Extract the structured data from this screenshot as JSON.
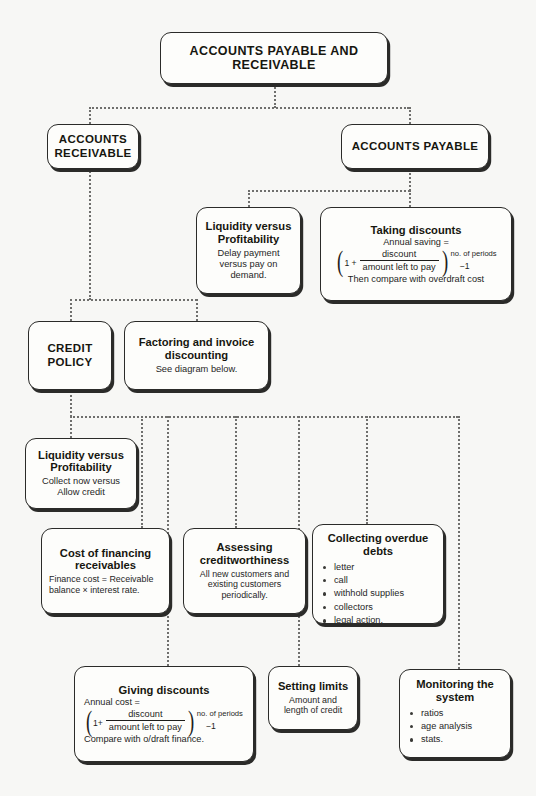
{
  "diagram": {
    "title": "ACCOUNTS PAYABLE AND RECEIVABLE",
    "background_color": "#f7f7f5",
    "line_color": "#6f6f6d",
    "box_border_color": "#2b2b29"
  },
  "nodes": {
    "root": {
      "title": "ACCOUNTS PAYABLE AND RECEIVABLE"
    },
    "accounts_receivable": {
      "title": "ACCOUNTS RECEIVABLE"
    },
    "accounts_payable": {
      "title": "ACCOUNTS PAYABLE"
    },
    "liquidity_payable": {
      "title": "Liquidity versus Profitability",
      "body": "Delay payment versus pay on demand."
    },
    "taking_discounts": {
      "title": "Taking discounts",
      "line1": "Annual saving =",
      "formula": {
        "lead": "1 +",
        "numerator": "discount",
        "denominator": "amount left to pay",
        "exponent": "no. of periods",
        "minus_one": "−1"
      },
      "footer": "Then compare with overdraft cost"
    },
    "credit_policy": {
      "title": "CREDIT POLICY"
    },
    "factoring": {
      "title": "Factoring and invoice discounting",
      "body": "See diagram below."
    },
    "liquidity_receivable": {
      "title": "Liquidity versus Profitability",
      "body": "Collect now versus Allow credit"
    },
    "cost_of_financing": {
      "title": "Cost of financing receivables",
      "body": "Finance cost = Receivable balance × interest rate."
    },
    "assessing_creditworthiness": {
      "title": "Assessing creditworthiness",
      "body": "All new customers and existing customers periodically."
    },
    "collecting_overdue_debts": {
      "title": "Collecting overdue debts",
      "bullets": [
        "letter",
        "call",
        "withhold supplies",
        "collectors",
        "legal action."
      ]
    },
    "giving_discounts": {
      "title": "Giving discounts",
      "line1": "Annual cost =",
      "formula": {
        "lead": "1+",
        "numerator": "discount",
        "denominator": "amount left to pay",
        "exponent": "no. of periods",
        "minus_one": "−1"
      },
      "footer": "Compare with o/draft finance."
    },
    "setting_limits": {
      "title": "Setting limits",
      "body": "Amount and length of credit"
    },
    "monitoring_the_system": {
      "title": "Monitoring the system",
      "bullets": [
        "ratios",
        "age analysis",
        "stats."
      ]
    }
  }
}
